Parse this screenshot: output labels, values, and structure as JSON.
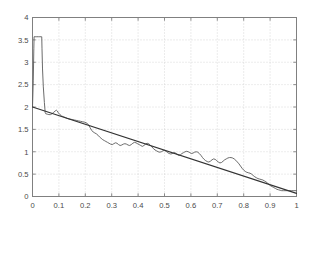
{
  "chart_data": {
    "type": "line",
    "title": "",
    "subtitle": "",
    "xlabel": "",
    "ylabel": "",
    "xlim": [
      0,
      1
    ],
    "ylim": [
      0,
      4
    ],
    "grid": true,
    "legend": "none",
    "background_color": "#ffffff",
    "frame_color": "#808080",
    "grid_color": "#c8c8c8",
    "xticks": [
      0,
      0.1,
      0.2,
      0.3,
      0.4,
      0.5,
      0.6,
      0.7,
      0.8,
      0.9,
      1
    ],
    "xtick_labels": [
      "0",
      "0.1",
      "0.2",
      "0.3",
      "0.4",
      "0.5",
      "0.6",
      "0.7",
      "0.8",
      "0.9",
      "1"
    ],
    "yticks": [
      0,
      0.5,
      1,
      1.5,
      2,
      2.5,
      3,
      3.5,
      4
    ],
    "ytick_labels": [
      "0",
      "0.5",
      "1",
      "1.5",
      "2",
      "2.5",
      "3",
      "3.5",
      "4"
    ],
    "series": [
      {
        "name": "noisy-signal",
        "type": "line",
        "color": "#5a5a5a",
        "width": 0.9,
        "points": [
          [
            0.0,
            2.0
          ],
          [
            0.003,
            2.6
          ],
          [
            0.005,
            3.3
          ],
          [
            0.006,
            3.57
          ],
          [
            0.01,
            3.57
          ],
          [
            0.016,
            3.57
          ],
          [
            0.022,
            3.57
          ],
          [
            0.028,
            3.57
          ],
          [
            0.033,
            3.57
          ],
          [
            0.035,
            3.57
          ],
          [
            0.036,
            3.3
          ],
          [
            0.038,
            2.85
          ],
          [
            0.041,
            2.45
          ],
          [
            0.045,
            2.1
          ],
          [
            0.048,
            1.88
          ],
          [
            0.05,
            1.85
          ],
          [
            0.056,
            1.84
          ],
          [
            0.062,
            1.83
          ],
          [
            0.068,
            1.83
          ],
          [
            0.074,
            1.85
          ],
          [
            0.08,
            1.88
          ],
          [
            0.086,
            1.91
          ],
          [
            0.09,
            1.93
          ],
          [
            0.094,
            1.91
          ],
          [
            0.098,
            1.87
          ],
          [
            0.104,
            1.83
          ],
          [
            0.11,
            1.8
          ],
          [
            0.118,
            1.78
          ],
          [
            0.126,
            1.76
          ],
          [
            0.134,
            1.74
          ],
          [
            0.142,
            1.73
          ],
          [
            0.15,
            1.72
          ],
          [
            0.158,
            1.71
          ],
          [
            0.166,
            1.7
          ],
          [
            0.174,
            1.69
          ],
          [
            0.182,
            1.68
          ],
          [
            0.19,
            1.67
          ],
          [
            0.198,
            1.66
          ],
          [
            0.206,
            1.64
          ],
          [
            0.212,
            1.6
          ],
          [
            0.218,
            1.54
          ],
          [
            0.224,
            1.48
          ],
          [
            0.23,
            1.44
          ],
          [
            0.236,
            1.42
          ],
          [
            0.242,
            1.4
          ],
          [
            0.248,
            1.37
          ],
          [
            0.254,
            1.33
          ],
          [
            0.26,
            1.3
          ],
          [
            0.266,
            1.27
          ],
          [
            0.272,
            1.25
          ],
          [
            0.278,
            1.23
          ],
          [
            0.284,
            1.21
          ],
          [
            0.29,
            1.19
          ],
          [
            0.296,
            1.17
          ],
          [
            0.302,
            1.16
          ],
          [
            0.308,
            1.18
          ],
          [
            0.314,
            1.2
          ],
          [
            0.32,
            1.19
          ],
          [
            0.326,
            1.16
          ],
          [
            0.332,
            1.14
          ],
          [
            0.338,
            1.15
          ],
          [
            0.344,
            1.17
          ],
          [
            0.35,
            1.18
          ],
          [
            0.356,
            1.17
          ],
          [
            0.362,
            1.15
          ],
          [
            0.368,
            1.14
          ],
          [
            0.374,
            1.16
          ],
          [
            0.38,
            1.19
          ],
          [
            0.386,
            1.21
          ],
          [
            0.392,
            1.2
          ],
          [
            0.398,
            1.18
          ],
          [
            0.404,
            1.16
          ],
          [
            0.41,
            1.14
          ],
          [
            0.416,
            1.12
          ],
          [
            0.422,
            1.14
          ],
          [
            0.428,
            1.17
          ],
          [
            0.434,
            1.19
          ],
          [
            0.44,
            1.18
          ],
          [
            0.446,
            1.15
          ],
          [
            0.452,
            1.11
          ],
          [
            0.458,
            1.07
          ],
          [
            0.464,
            1.04
          ],
          [
            0.47,
            1.02
          ],
          [
            0.476,
            1.0
          ],
          [
            0.482,
            0.99
          ],
          [
            0.488,
            1.0
          ],
          [
            0.494,
            1.02
          ],
          [
            0.5,
            1.03
          ],
          [
            0.506,
            1.01
          ],
          [
            0.512,
            0.98
          ],
          [
            0.518,
            0.96
          ],
          [
            0.524,
            0.95
          ],
          [
            0.53,
            0.96
          ],
          [
            0.536,
            0.98
          ],
          [
            0.542,
            0.97
          ],
          [
            0.548,
            0.94
          ],
          [
            0.554,
            0.92
          ],
          [
            0.56,
            0.93
          ],
          [
            0.566,
            0.96
          ],
          [
            0.572,
            0.98
          ],
          [
            0.578,
            1.0
          ],
          [
            0.584,
            1.01
          ],
          [
            0.59,
            1.0
          ],
          [
            0.596,
            0.98
          ],
          [
            0.602,
            0.96
          ],
          [
            0.608,
            0.97
          ],
          [
            0.614,
            0.99
          ],
          [
            0.62,
            1.0
          ],
          [
            0.626,
            0.99
          ],
          [
            0.632,
            0.96
          ],
          [
            0.638,
            0.92
          ],
          [
            0.644,
            0.87
          ],
          [
            0.65,
            0.83
          ],
          [
            0.656,
            0.8
          ],
          [
            0.662,
            0.78
          ],
          [
            0.668,
            0.77
          ],
          [
            0.674,
            0.79
          ],
          [
            0.68,
            0.82
          ],
          [
            0.686,
            0.84
          ],
          [
            0.692,
            0.83
          ],
          [
            0.698,
            0.8
          ],
          [
            0.704,
            0.77
          ],
          [
            0.71,
            0.75
          ],
          [
            0.716,
            0.76
          ],
          [
            0.722,
            0.79
          ],
          [
            0.728,
            0.82
          ],
          [
            0.734,
            0.84
          ],
          [
            0.74,
            0.86
          ],
          [
            0.746,
            0.87
          ],
          [
            0.752,
            0.87
          ],
          [
            0.758,
            0.86
          ],
          [
            0.764,
            0.84
          ],
          [
            0.77,
            0.81
          ],
          [
            0.776,
            0.77
          ],
          [
            0.782,
            0.73
          ],
          [
            0.788,
            0.68
          ],
          [
            0.794,
            0.63
          ],
          [
            0.8,
            0.59
          ],
          [
            0.806,
            0.56
          ],
          [
            0.812,
            0.54
          ],
          [
            0.818,
            0.53
          ],
          [
            0.824,
            0.52
          ],
          [
            0.83,
            0.5
          ],
          [
            0.836,
            0.47
          ],
          [
            0.842,
            0.44
          ],
          [
            0.848,
            0.42
          ],
          [
            0.854,
            0.4
          ],
          [
            0.86,
            0.39
          ],
          [
            0.866,
            0.38
          ],
          [
            0.872,
            0.37
          ],
          [
            0.878,
            0.35
          ],
          [
            0.884,
            0.33
          ],
          [
            0.89,
            0.3
          ],
          [
            0.896,
            0.27
          ],
          [
            0.902,
            0.24
          ],
          [
            0.908,
            0.22
          ],
          [
            0.914,
            0.2
          ],
          [
            0.92,
            0.18
          ],
          [
            0.926,
            0.16
          ],
          [
            0.932,
            0.15
          ],
          [
            0.938,
            0.14
          ],
          [
            0.944,
            0.13
          ],
          [
            0.95,
            0.13
          ],
          [
            0.96,
            0.13
          ],
          [
            0.97,
            0.13
          ],
          [
            0.98,
            0.13
          ],
          [
            0.99,
            0.13
          ],
          [
            1.0,
            0.13
          ]
        ]
      },
      {
        "name": "regression-line",
        "type": "line",
        "color": "#333333",
        "width": 1.1,
        "points": [
          [
            0.0,
            2.0
          ],
          [
            1.0,
            0.07
          ]
        ]
      }
    ]
  }
}
